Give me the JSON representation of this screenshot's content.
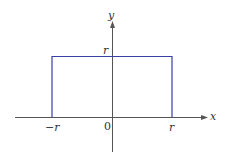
{
  "diagram": {
    "type": "piecewise-constant function graph",
    "axes": {
      "x_label": "x",
      "y_label": "y",
      "origin_label": "0"
    },
    "tick_labels": {
      "x_left": "−r",
      "x_right": "r",
      "y_top": "r"
    },
    "curve": {
      "description": "horizontal segment y = r for −r ≤ x ≤ r with vertical drops to the x-axis at x = −r and x = r",
      "color": "#3a3fa8"
    },
    "axis_color": "#555555"
  }
}
